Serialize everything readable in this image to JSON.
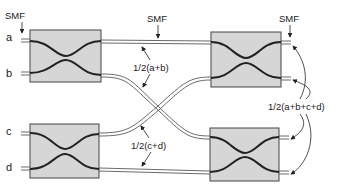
{
  "diagram": {
    "inputs": [
      {
        "id": "a",
        "label": "a"
      },
      {
        "id": "b",
        "label": "b"
      },
      {
        "id": "c",
        "label": "c"
      },
      {
        "id": "d",
        "label": "d"
      }
    ],
    "smf_labels": [
      "SMF",
      "SMF",
      "SMF"
    ],
    "annotations": {
      "half_ab": "1/2(a+b)",
      "half_cd": "1/2(c+d)",
      "half_abcd": "1/2(a+b+c+d)"
    },
    "colors": {
      "coupler_fill": "#d6d6d6",
      "coupler_border": "#444444",
      "fiber": "#333333"
    }
  }
}
